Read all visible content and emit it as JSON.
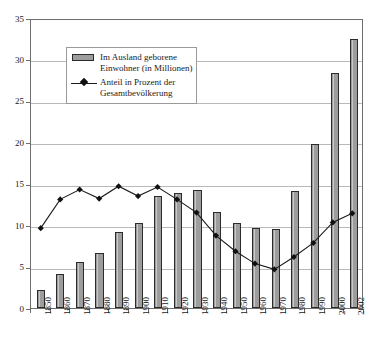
{
  "chart_data": {
    "type": "bar",
    "title": "",
    "subtitle": "",
    "xlabel": "",
    "ylabel": "",
    "ylim": [
      0,
      35
    ],
    "yticks": [
      0,
      5,
      10,
      15,
      20,
      25,
      30,
      35
    ],
    "grid": true,
    "legend_position": "upper-left-inside",
    "categories": [
      "1850",
      "1860",
      "1870",
      "1880",
      "1890",
      "1900",
      "1910",
      "1920",
      "1930",
      "1940",
      "1950",
      "1960",
      "1970",
      "1980",
      "1990",
      "2000",
      "2002"
    ],
    "series": [
      {
        "name": "Im Ausland geborene Einwohner (in Millionen)",
        "type": "bar",
        "values": [
          2.2,
          4.1,
          5.6,
          6.7,
          9.2,
          10.3,
          13.5,
          13.9,
          14.2,
          11.6,
          10.3,
          9.7,
          9.6,
          14.1,
          19.8,
          28.4,
          32.5
        ]
      },
      {
        "name": "Anteil in Prozent der Gesamtbevölkerung",
        "type": "line",
        "values": [
          9.7,
          13.2,
          14.4,
          13.3,
          14.8,
          13.6,
          14.7,
          13.2,
          11.6,
          8.8,
          6.9,
          5.4,
          4.7,
          6.2,
          7.9,
          10.4,
          11.5
        ]
      }
    ]
  },
  "legend": {
    "entries": [
      {
        "key": "bar-swatch",
        "line1": "Im Ausland geborene",
        "line2": "Einwohner (in Millionen)"
      },
      {
        "key": "line-marker",
        "line1": "Anteil in Prozent der",
        "line2": "Gesamtbevölkerung"
      }
    ]
  },
  "colors": {
    "bar_fill": "#9d9d9d",
    "bar_border": "#2b2b2b",
    "line": "#1a1a1a",
    "marker": "#111111",
    "gridline": "#b9b9b9",
    "frame": "#6e6e6e",
    "background": "#ffffff"
  }
}
